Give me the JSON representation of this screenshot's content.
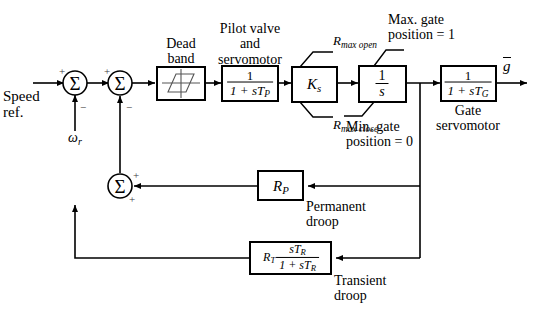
{
  "diagram": {
    "type": "control-block-diagram",
    "stroke_color": "#000000",
    "background_color": "#ffffff",
    "inputs": {
      "speed_ref_label": "Speed\nref.",
      "speed_ref_line1": "Speed",
      "speed_ref_line2": "ref.",
      "omega_r": "ω",
      "omega_r_sub": "r"
    },
    "output": {
      "g_bar": "g",
      "overbar": true
    },
    "sum_junctions": [
      {
        "name": "sum-1",
        "glyph": "Σ",
        "signs": [
          "+",
          "−"
        ]
      },
      {
        "name": "sum-2",
        "glyph": "Σ",
        "signs": [
          "+",
          "−"
        ]
      },
      {
        "name": "sum-3",
        "glyph": "Σ",
        "signs": [
          "+",
          "+"
        ]
      }
    ],
    "blocks": [
      {
        "name": "dead-band",
        "caption_line1": "Dead",
        "caption_line2": "band",
        "content": "hysteresis-glyph"
      },
      {
        "name": "pilot-valve-servomotor",
        "caption_line1": "Pilot valve",
        "caption_line2": "and",
        "caption_line3": "servomotor",
        "numerator": "1",
        "denominator": "1 + sT",
        "denominator_sub": "P"
      },
      {
        "name": "gain-ks",
        "content": "K",
        "content_sub": "s",
        "annotation_top": "R",
        "annotation_top_sub": "max open",
        "annotation_bottom": "R",
        "annotation_bottom_sub": "max close"
      },
      {
        "name": "integrator",
        "numerator": "1",
        "denominator": "s",
        "annotation_top_line1": "Max. gate",
        "annotation_top_line2": "position = 1",
        "annotation_bottom_line1": "Min. gate",
        "annotation_bottom_line2": "position = 0"
      },
      {
        "name": "gate-servomotor",
        "caption_line1": "Gate",
        "caption_line2": "servomotor",
        "numerator": "1",
        "denominator": "1 + sT",
        "denominator_sub": "G"
      },
      {
        "name": "permanent-droop",
        "content": "R",
        "content_sub": "P",
        "caption_line1": "Permanent",
        "caption_line2": "droop"
      },
      {
        "name": "transient-droop",
        "prefix": "R",
        "prefix_sub": "T",
        "numerator": "sT",
        "numerator_sub": "R",
        "denominator": "1 + sT",
        "denominator_sub": "R",
        "caption_line1": "Transient",
        "caption_line2": "droop"
      }
    ]
  }
}
